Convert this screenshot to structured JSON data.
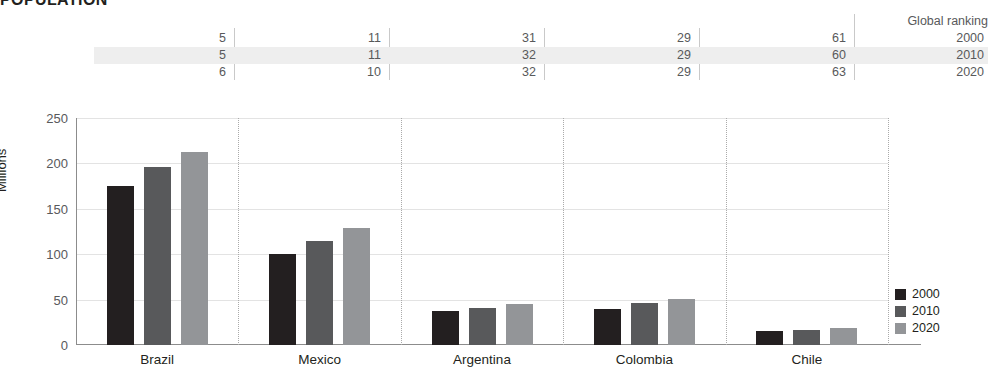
{
  "title": "POPULATION",
  "ranking": {
    "header": "Global ranking",
    "years": [
      "2000",
      "2010",
      "2020"
    ],
    "rows": [
      {
        "year": "2000",
        "values": [
          "5",
          "11",
          "31",
          "29",
          "61"
        ]
      },
      {
        "year": "2010",
        "values": [
          "5",
          "11",
          "32",
          "29",
          "60"
        ]
      },
      {
        "year": "2020",
        "values": [
          "6",
          "10",
          "32",
          "29",
          "63"
        ]
      }
    ]
  },
  "axes": {
    "ylabel": "Millions",
    "yticks": [
      "0",
      "50",
      "100",
      "150",
      "200",
      "250"
    ],
    "xlabel": ""
  },
  "legend": {
    "position": "right",
    "items": [
      {
        "label": "2000",
        "color": "#231f20"
      },
      {
        "label": "2010",
        "color": "#58595b"
      },
      {
        "label": "2020",
        "color": "#939598"
      }
    ]
  },
  "colors": {
    "series_2000": "#231f20",
    "series_2010": "#58595b",
    "series_2020": "#939598",
    "highlight_row": "#eeeeee",
    "grid": "#e3e3e3",
    "axis": "#8c8c8c"
  },
  "chart_data": {
    "type": "bar",
    "title": "POPULATION",
    "subtitle": "",
    "xlabel": "",
    "ylabel": "Millions",
    "ylim": [
      0,
      250
    ],
    "yticks": [
      0,
      50,
      100,
      150,
      200,
      250
    ],
    "grid": true,
    "legend_position": "right",
    "categories": [
      "Brazil",
      "Mexico",
      "Argentina",
      "Colombia",
      "Chile"
    ],
    "series": [
      {
        "name": "2000",
        "color": "#231f20",
        "values": [
          175,
          100,
          37,
          40,
          15
        ]
      },
      {
        "name": "2010",
        "color": "#58595b",
        "values": [
          196,
          115,
          41,
          46,
          17
        ]
      },
      {
        "name": "2020",
        "color": "#939598",
        "values": [
          213,
          129,
          45,
          51,
          19
        ]
      }
    ],
    "annotations": {
      "table_title": "Global ranking",
      "table_rows": [
        {
          "year": "2000",
          "Brazil": 5,
          "Mexico": 11,
          "Argentina": 31,
          "Colombia": 29,
          "Chile": 61
        },
        {
          "year": "2010",
          "Brazil": 5,
          "Mexico": 11,
          "Argentina": 32,
          "Colombia": 29,
          "Chile": 60
        },
        {
          "year": "2020",
          "Brazil": 6,
          "Mexico": 10,
          "Argentina": 32,
          "Colombia": 29,
          "Chile": 63
        }
      ]
    }
  }
}
